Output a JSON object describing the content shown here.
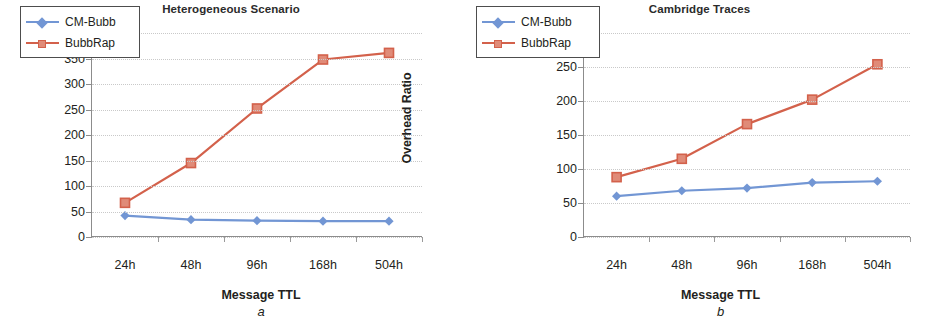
{
  "figure": {
    "panels": [
      {
        "caption": "a",
        "title": "Heterogeneous Scenario",
        "xlabel": "Message TTL",
        "ylabel": "Overhead Ratio"
      },
      {
        "caption": "b",
        "title": "Cambridge Traces",
        "xlabel": "Message TTL",
        "ylabel": "Overhead Ratio"
      }
    ]
  },
  "colors": {
    "cm_bubb": "#7296d4",
    "bubb_rap": "#d3614b",
    "axis": "#8c8c8c",
    "grid": "#c9c9c9",
    "text": "#231f20"
  },
  "chart_data": [
    {
      "type": "line",
      "title": "Heterogeneous Scenario",
      "caption": "a",
      "xlabel": "Message TTL",
      "ylabel": "Overhead Ratio",
      "categories": [
        "24h",
        "48h",
        "96h",
        "168h",
        "504h"
      ],
      "ylim": [
        0,
        400
      ],
      "ytick_step": 50,
      "yticks": [
        0,
        50,
        100,
        150,
        200,
        250,
        300,
        350,
        400
      ],
      "grid": true,
      "legend_position": "top-left",
      "series": [
        {
          "name": "CM-Bubb",
          "values": [
            42,
            34,
            32,
            31,
            31
          ],
          "color": "#7296d4",
          "marker": "diamond"
        },
        {
          "name": "BubbRap",
          "values": [
            67,
            145,
            252,
            348,
            361
          ],
          "color": "#d3614b",
          "marker": "square"
        }
      ]
    },
    {
      "type": "line",
      "title": "Cambridge Traces",
      "caption": "b",
      "xlabel": "Message TTL",
      "ylabel": "Overhead Ratio",
      "categories": [
        "24h",
        "48h",
        "96h",
        "168h",
        "504h"
      ],
      "ylim": [
        0,
        300
      ],
      "ytick_step": 50,
      "yticks": [
        0,
        50,
        100,
        150,
        200,
        250,
        300
      ],
      "grid": true,
      "legend_position": "top-left",
      "series": [
        {
          "name": "CM-Bubb",
          "values": [
            60,
            68,
            72,
            80,
            82
          ],
          "color": "#7296d4",
          "marker": "diamond"
        },
        {
          "name": "BubbRap",
          "values": [
            88,
            115,
            166,
            202,
            254
          ],
          "color": "#d3614b",
          "marker": "square"
        }
      ]
    }
  ]
}
